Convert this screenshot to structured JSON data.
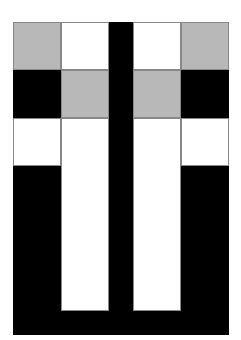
{
  "figure": {
    "colors": {
      "black": "#000000",
      "gray": "#b8b8b8",
      "white": "#ffffff",
      "grid_line": "#888888"
    },
    "blocks": [
      {
        "name": "top-left-gray",
        "x": 13,
        "y": 22,
        "w": 48,
        "h": 48,
        "color": "gray"
      },
      {
        "name": "top-left-white",
        "x": 61,
        "y": 22,
        "w": 48,
        "h": 48,
        "color": "white"
      },
      {
        "name": "top-right-white",
        "x": 133,
        "y": 22,
        "w": 48,
        "h": 48,
        "color": "white"
      },
      {
        "name": "top-right-gray",
        "x": 181,
        "y": 22,
        "w": 48,
        "h": 48,
        "color": "gray"
      },
      {
        "name": "mid-left-black",
        "x": 13,
        "y": 70,
        "w": 48,
        "h": 48,
        "color": "black"
      },
      {
        "name": "mid-left-gray",
        "x": 61,
        "y": 70,
        "w": 48,
        "h": 48,
        "color": "gray"
      },
      {
        "name": "mid-right-gray",
        "x": 133,
        "y": 70,
        "w": 48,
        "h": 48,
        "color": "gray"
      },
      {
        "name": "mid-right-black",
        "x": 181,
        "y": 70,
        "w": 48,
        "h": 48,
        "color": "black"
      },
      {
        "name": "row3-left-white",
        "x": 13,
        "y": 118,
        "w": 48,
        "h": 48,
        "color": "white"
      },
      {
        "name": "row3-right-white",
        "x": 181,
        "y": 118,
        "w": 48,
        "h": 48,
        "color": "white"
      },
      {
        "name": "bottom-black-u",
        "x": 13,
        "y": 166,
        "w": 216,
        "h": 169,
        "color": "black"
      },
      {
        "name": "center-black-bar",
        "x": 109,
        "y": 22,
        "w": 24,
        "h": 313,
        "color": "black"
      },
      {
        "name": "inner-left-white-column",
        "x": 61,
        "y": 118,
        "w": 48,
        "h": 193,
        "color": "white"
      },
      {
        "name": "inner-right-white-column",
        "x": 133,
        "y": 118,
        "w": 48,
        "h": 193,
        "color": "white"
      }
    ]
  }
}
